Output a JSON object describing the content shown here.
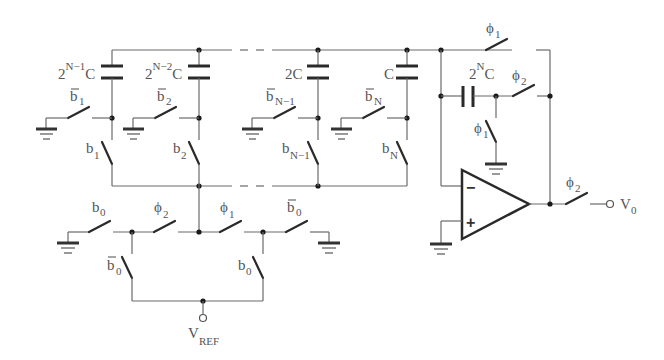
{
  "diagram": {
    "capacitors": [
      {
        "id": "c1",
        "label_base": "2",
        "label_sup": "N−1",
        "label_suffix": "C"
      },
      {
        "id": "c2",
        "label_base": "2",
        "label_sup": "N−2",
        "label_suffix": "C"
      },
      {
        "id": "cn1",
        "label_base": "2C"
      },
      {
        "id": "cn",
        "label_base": "C"
      },
      {
        "id": "cf",
        "label_base": "2",
        "label_sup": "N",
        "label_suffix": "C"
      }
    ],
    "switches": {
      "b1bar": {
        "base": "b",
        "sub": "1",
        "bar": true
      },
      "b2bar": {
        "base": "b",
        "sub": "2",
        "bar": true
      },
      "bn1bar": {
        "base": "b",
        "sub": "N−1",
        "bar": true
      },
      "bnbar": {
        "base": "b",
        "sub": "N",
        "bar": true
      },
      "b1": {
        "base": "b",
        "sub": "1"
      },
      "b2": {
        "base": "b",
        "sub": "2"
      },
      "bn1": {
        "base": "b",
        "sub": "N−1"
      },
      "bn": {
        "base": "b",
        "sub": "N"
      },
      "b0_left": {
        "base": "b",
        "sub": "0"
      },
      "phi2_mid": {
        "base": "ϕ",
        "sub": "2"
      },
      "phi1_mid": {
        "base": "ϕ",
        "sub": "1"
      },
      "b0bar_right": {
        "base": "b",
        "sub": "0",
        "bar": true
      },
      "b0bar_down": {
        "base": "b",
        "sub": "0",
        "bar": true
      },
      "b0_down": {
        "base": "b",
        "sub": "0"
      },
      "phi1_top": {
        "base": "ϕ",
        "sub": "1"
      },
      "phi2_fb": {
        "base": "ϕ",
        "sub": "2"
      },
      "phi1_gnd": {
        "base": "ϕ",
        "sub": "1"
      },
      "phi2_out": {
        "base": "ϕ",
        "sub": "2"
      }
    },
    "terminals": {
      "vref": {
        "base": "V",
        "sub": "REF"
      },
      "vout": {
        "base": "V",
        "sub": "0"
      }
    },
    "opamp": {
      "minus": "−",
      "plus": "+"
    }
  }
}
